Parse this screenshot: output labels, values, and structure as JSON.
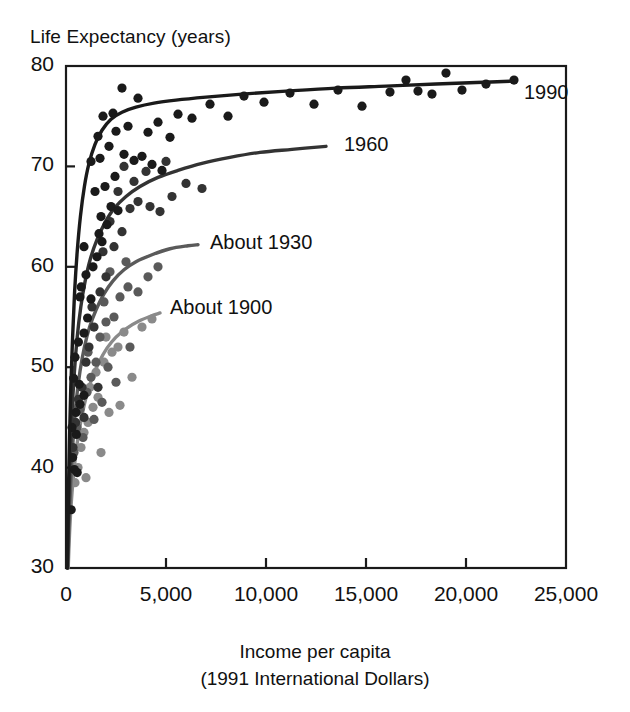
{
  "chart_data": {
    "type": "scatter",
    "title": "Life Expectancy (years)",
    "ylabel": "Life Expectancy (years)",
    "xlabel": "Income per capita",
    "xlabel_line2": "(1991 International Dollars)",
    "xlim": [
      0,
      25000
    ],
    "ylim": [
      30,
      80
    ],
    "grid": false,
    "legend_position": "inline-curve-labels",
    "xticks": [
      0,
      5000,
      10000,
      15000,
      20000,
      25000
    ],
    "xticklabels": [
      "0",
      "5,000",
      "10,000",
      "15,000",
      "20,000",
      "25,000"
    ],
    "yticks": [
      30,
      40,
      50,
      60,
      70,
      80
    ],
    "yticklabels": [
      "30",
      "40",
      "50",
      "60",
      "70",
      "80"
    ],
    "series": [
      {
        "name": "1990",
        "label": "1990",
        "color": "#1a1a1a",
        "label_x": 22600,
        "label_y": 77.2,
        "curve": [
          [
            60,
            30.0
          ],
          [
            110,
            36.0
          ],
          [
            170,
            42.5
          ],
          [
            240,
            48.0
          ],
          [
            330,
            53.0
          ],
          [
            430,
            57.5
          ],
          [
            560,
            61.5
          ],
          [
            720,
            65.0
          ],
          [
            920,
            68.0
          ],
          [
            1150,
            70.3
          ],
          [
            1450,
            72.2
          ],
          [
            1800,
            73.6
          ],
          [
            2250,
            74.7
          ],
          [
            2800,
            75.4
          ],
          [
            3500,
            75.9
          ],
          [
            4400,
            76.3
          ],
          [
            5500,
            76.6
          ],
          [
            7000,
            76.9
          ],
          [
            8800,
            77.2
          ],
          [
            11000,
            77.5
          ],
          [
            13500,
            77.8
          ],
          [
            16000,
            78.0
          ],
          [
            18500,
            78.2
          ],
          [
            20500,
            78.35
          ],
          [
            22500,
            78.5
          ]
        ],
        "points": [
          [
            260,
            35.8
          ],
          [
            330,
            41.0
          ],
          [
            420,
            39.8
          ],
          [
            560,
            39.5
          ],
          [
            520,
            43.3
          ],
          [
            700,
            46.3
          ],
          [
            660,
            48.3
          ],
          [
            900,
            47.2
          ],
          [
            380,
            48.9
          ],
          [
            450,
            51.0
          ],
          [
            620,
            52.5
          ],
          [
            900,
            53.4
          ],
          [
            1080,
            54.9
          ],
          [
            1250,
            56.8
          ],
          [
            760,
            58.0
          ],
          [
            1000,
            59.2
          ],
          [
            1350,
            60.0
          ],
          [
            1550,
            61.0
          ],
          [
            1800,
            62.5
          ],
          [
            1650,
            63.3
          ],
          [
            2050,
            64.2
          ],
          [
            1750,
            65.0
          ],
          [
            2250,
            66.0
          ],
          [
            2600,
            65.6
          ],
          [
            1450,
            67.5
          ],
          [
            1950,
            68.0
          ],
          [
            2450,
            69.0
          ],
          [
            1250,
            70.5
          ],
          [
            1700,
            70.8
          ],
          [
            2150,
            72.0
          ],
          [
            2900,
            71.2
          ],
          [
            3400,
            70.6
          ],
          [
            2500,
            73.5
          ],
          [
            3100,
            74.0
          ],
          [
            1850,
            75.0
          ],
          [
            2350,
            75.3
          ],
          [
            3800,
            71.0
          ],
          [
            4300,
            70.2
          ],
          [
            4800,
            69.6
          ],
          [
            4100,
            73.4
          ],
          [
            5200,
            72.9
          ],
          [
            3600,
            76.8
          ],
          [
            4600,
            74.4
          ],
          [
            5600,
            75.2
          ],
          [
            6300,
            74.8
          ],
          [
            7200,
            76.2
          ],
          [
            8100,
            75.0
          ],
          [
            8900,
            77.0
          ],
          [
            9900,
            76.4
          ],
          [
            11200,
            77.3
          ],
          [
            12400,
            76.2
          ],
          [
            13600,
            77.6
          ],
          [
            14800,
            76.0
          ],
          [
            16200,
            77.4
          ],
          [
            17000,
            78.6
          ],
          [
            17600,
            77.5
          ],
          [
            18300,
            77.2
          ],
          [
            19000,
            79.3
          ],
          [
            19800,
            77.6
          ],
          [
            21000,
            78.2
          ],
          [
            22400,
            78.6
          ],
          [
            2800,
            77.8
          ],
          [
            1600,
            73.0
          ],
          [
            900,
            62.0
          ],
          [
            700,
            57.0
          ],
          [
            500,
            45.5
          ],
          [
            300,
            44.0
          ]
        ]
      },
      {
        "name": "1960",
        "label": "1960",
        "color": "#333333",
        "label_x": 13600,
        "label_y": 72.0,
        "curve": [
          [
            70,
            30.0
          ],
          [
            130,
            35.5
          ],
          [
            210,
            41.0
          ],
          [
            300,
            45.5
          ],
          [
            420,
            49.5
          ],
          [
            560,
            53.0
          ],
          [
            740,
            56.0
          ],
          [
            960,
            58.6
          ],
          [
            1220,
            60.8
          ],
          [
            1550,
            62.7
          ],
          [
            1950,
            64.4
          ],
          [
            2400,
            65.8
          ],
          [
            3000,
            67.0
          ],
          [
            3700,
            68.0
          ],
          [
            4600,
            68.9
          ],
          [
            5600,
            69.6
          ],
          [
            6800,
            70.3
          ],
          [
            8200,
            70.9
          ],
          [
            9700,
            71.4
          ],
          [
            11300,
            71.7
          ],
          [
            13000,
            72.0
          ]
        ],
        "points": [
          [
            350,
            42.0
          ],
          [
            480,
            44.5
          ],
          [
            620,
            46.8
          ],
          [
            800,
            48.0
          ],
          [
            1000,
            50.5
          ],
          [
            1150,
            52.0
          ],
          [
            1400,
            54.0
          ],
          [
            1300,
            56.0
          ],
          [
            1700,
            57.5
          ],
          [
            2000,
            59.0
          ],
          [
            1850,
            61.5
          ],
          [
            2400,
            62.0
          ],
          [
            2200,
            64.5
          ],
          [
            2800,
            63.5
          ],
          [
            3200,
            65.8
          ],
          [
            3600,
            66.5
          ],
          [
            4200,
            66.0
          ],
          [
            4700,
            65.5
          ],
          [
            2600,
            67.5
          ],
          [
            3400,
            68.5
          ],
          [
            5300,
            67.0
          ],
          [
            6000,
            68.3
          ],
          [
            6800,
            67.8
          ],
          [
            4000,
            69.5
          ],
          [
            5000,
            70.5
          ],
          [
            2900,
            70.0
          ],
          [
            1600,
            48.0
          ],
          [
            900,
            45.0
          ]
        ]
      },
      {
        "name": "About 1930",
        "label": "About 1930",
        "color": "#5a5a5a",
        "label_x": 6900,
        "label_y": 62.3,
        "curve": [
          [
            90,
            30.0
          ],
          [
            160,
            35.0
          ],
          [
            260,
            39.5
          ],
          [
            380,
            43.5
          ],
          [
            520,
            46.8
          ],
          [
            700,
            49.6
          ],
          [
            920,
            52.0
          ],
          [
            1180,
            54.0
          ],
          [
            1500,
            55.7
          ],
          [
            1900,
            57.3
          ],
          [
            2350,
            58.6
          ],
          [
            2900,
            59.7
          ],
          [
            3500,
            60.5
          ],
          [
            4300,
            61.2
          ],
          [
            5200,
            61.8
          ],
          [
            6100,
            62.1
          ],
          [
            6600,
            62.2
          ]
        ],
        "points": [
          [
            400,
            41.5
          ],
          [
            550,
            44.0
          ],
          [
            700,
            45.8
          ],
          [
            850,
            43.0
          ],
          [
            1050,
            47.5
          ],
          [
            1250,
            49.0
          ],
          [
            1100,
            51.5
          ],
          [
            1500,
            50.5
          ],
          [
            1700,
            53.0
          ],
          [
            2000,
            54.5
          ],
          [
            1900,
            56.5
          ],
          [
            2400,
            55.0
          ],
          [
            2700,
            57.0
          ],
          [
            3100,
            58.0
          ],
          [
            3600,
            57.5
          ],
          [
            2200,
            59.5
          ],
          [
            3000,
            60.5
          ],
          [
            4100,
            59.0
          ],
          [
            4600,
            60.0
          ],
          [
            1400,
            44.8
          ],
          [
            1800,
            46.5
          ],
          [
            2500,
            48.5
          ],
          [
            3200,
            52.0
          ],
          [
            2100,
            50.0
          ]
        ]
      },
      {
        "name": "About 1900",
        "label": "About 1900",
        "color": "#8a8a8a",
        "label_x": 4900,
        "label_y": 55.8,
        "curve": [
          [
            110,
            30.0
          ],
          [
            190,
            34.0
          ],
          [
            300,
            37.5
          ],
          [
            440,
            40.5
          ],
          [
            600,
            43.0
          ],
          [
            800,
            45.2
          ],
          [
            1030,
            47.2
          ],
          [
            1300,
            48.9
          ],
          [
            1650,
            50.5
          ],
          [
            2050,
            51.9
          ],
          [
            2500,
            53.0
          ],
          [
            3050,
            53.9
          ],
          [
            3650,
            54.6
          ],
          [
            4250,
            55.1
          ],
          [
            4700,
            55.4
          ]
        ],
        "points": [
          [
            450,
            38.5
          ],
          [
            600,
            40.0
          ],
          [
            750,
            42.0
          ],
          [
            900,
            43.5
          ],
          [
            1100,
            44.5
          ],
          [
            1350,
            46.0
          ],
          [
            1200,
            48.0
          ],
          [
            1600,
            47.0
          ],
          [
            1500,
            49.5
          ],
          [
            1900,
            50.5
          ],
          [
            2300,
            51.5
          ],
          [
            2000,
            53.0
          ],
          [
            2600,
            52.0
          ],
          [
            2900,
            53.5
          ],
          [
            3300,
            49.0
          ],
          [
            1750,
            41.5
          ],
          [
            2150,
            45.5
          ],
          [
            1000,
            39.0
          ],
          [
            3800,
            54.0
          ],
          [
            4300,
            54.8
          ],
          [
            2700,
            46.2
          ]
        ]
      }
    ]
  }
}
